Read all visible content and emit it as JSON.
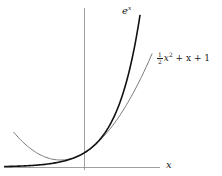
{
  "chart_data": {
    "type": "line",
    "title": "",
    "xlabel": "x",
    "ylabel": "",
    "xlim": [
      -3.5,
      5.8
    ],
    "ylim": [
      0,
      11.2
    ],
    "grid": false,
    "axes": {
      "x_axis_visible": true,
      "y_axis_visible": true,
      "ticks": false
    },
    "series": [
      {
        "name": "e^x",
        "label_base": "e",
        "label_sup": "x",
        "stroke": "#111111",
        "stroke_width": 1.6,
        "x_range": [
          -3.4,
          2.385
        ],
        "x": [
          -3.4,
          -3,
          -2.5,
          -2,
          -1.5,
          -1,
          -0.5,
          0,
          0.5,
          1,
          1.5,
          2,
          2.385
        ],
        "values": [
          0.033,
          0.05,
          0.082,
          0.135,
          0.223,
          0.368,
          0.607,
          1.0,
          1.649,
          2.718,
          4.482,
          7.389,
          10.86
        ]
      },
      {
        "name": "1/2 x^2 + x + 1",
        "label_frac_num": "1",
        "label_frac_den": "2",
        "label_rest_pre": "x",
        "label_rest_sup": "2",
        "label_rest_post": " + x + 1",
        "stroke": "#777777",
        "stroke_width": 1.0,
        "x_range": [
          -3.0,
          2.9
        ],
        "x": [
          -3,
          -2.5,
          -2,
          -1.5,
          -1,
          -0.5,
          0,
          0.5,
          1,
          1.5,
          2,
          2.5,
          2.9
        ],
        "values": [
          2.5,
          1.625,
          1.0,
          0.625,
          0.5,
          0.625,
          1.0,
          1.625,
          2.5,
          3.625,
          5.0,
          6.625,
          8.105
        ]
      }
    ],
    "annotations": [
      {
        "text": "e^x",
        "near": "top of e^x curve"
      },
      {
        "text": "1/2 x^2 + x + 1",
        "near": "top of quadratic curve"
      },
      {
        "text": "x",
        "near": "right end of x-axis"
      }
    ]
  },
  "labels": {
    "exp_base": "e",
    "exp_sup": "x",
    "quad_num": "1",
    "quad_den": "2",
    "quad_x": "x",
    "quad_sup": "2",
    "quad_rest": " + x + 1",
    "x_axis": "x"
  },
  "geometry": {
    "origin_px": [
      84,
      167
    ],
    "scale_x_px": 23.5,
    "scale_y_px": 14
  }
}
